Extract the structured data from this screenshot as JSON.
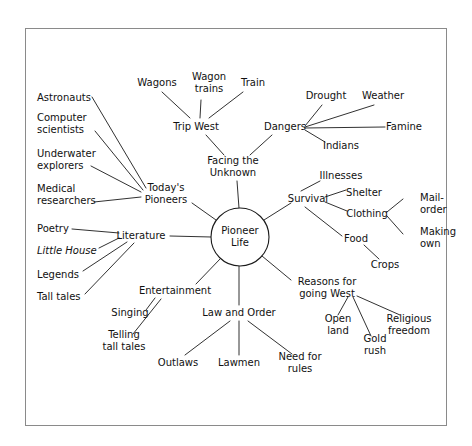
{
  "diagram": {
    "type": "mind-map",
    "title_node": "Pioneer Life",
    "frame_color": "#8a8a8a",
    "line_color": "#1a1a1a",
    "text_color": "#111111",
    "nodes": [
      {
        "id": "pioneer_life",
        "label": "Pioneer Life",
        "lines": [
          "Pioneer",
          "Life"
        ],
        "x": 240,
        "y": 237,
        "shape": "circle",
        "radius": 29,
        "anchor": "center"
      },
      {
        "id": "facing_unknown",
        "label": "Facing the Unknown",
        "lines": [
          "Facing the",
          "Unknown"
        ],
        "x": 233,
        "y": 167,
        "anchor": "center"
      },
      {
        "id": "trip_west",
        "label": "Trip West",
        "lines": [
          "Trip West"
        ],
        "x": 196,
        "y": 127,
        "anchor": "center"
      },
      {
        "id": "wagons",
        "label": "Wagons",
        "lines": [
          "Wagons"
        ],
        "x": 157,
        "y": 83,
        "anchor": "center"
      },
      {
        "id": "wagon_trains",
        "label": "Wagon trains",
        "lines": [
          "Wagon",
          "trains"
        ],
        "x": 209,
        "y": 83,
        "anchor": "center"
      },
      {
        "id": "train",
        "label": "Train",
        "lines": [
          "Train"
        ],
        "x": 253,
        "y": 83,
        "anchor": "center"
      },
      {
        "id": "dangers",
        "label": "Dangers",
        "lines": [
          "Dangers"
        ],
        "x": 285,
        "y": 127,
        "anchor": "center"
      },
      {
        "id": "drought",
        "label": "Drought",
        "lines": [
          "Drought"
        ],
        "x": 326,
        "y": 96,
        "anchor": "center"
      },
      {
        "id": "weather",
        "label": "Weather",
        "lines": [
          "Weather"
        ],
        "x": 383,
        "y": 96,
        "anchor": "center"
      },
      {
        "id": "famine",
        "label": "Famine",
        "lines": [
          "Famine"
        ],
        "x": 404,
        "y": 127,
        "anchor": "center"
      },
      {
        "id": "indians",
        "label": "Indians",
        "lines": [
          "Indians"
        ],
        "x": 341,
        "y": 146,
        "anchor": "center"
      },
      {
        "id": "survival",
        "label": "Survival",
        "lines": [
          "Survival"
        ],
        "x": 308,
        "y": 199,
        "anchor": "center"
      },
      {
        "id": "illnesses",
        "label": "Illnesses",
        "lines": [
          "Illnesses"
        ],
        "x": 341,
        "y": 176,
        "anchor": "center"
      },
      {
        "id": "shelter",
        "label": "Shelter",
        "lines": [
          "Shelter"
        ],
        "x": 364,
        "y": 193,
        "anchor": "center"
      },
      {
        "id": "clothing",
        "label": "Clothing",
        "lines": [
          "Clothing"
        ],
        "x": 367,
        "y": 214,
        "anchor": "center"
      },
      {
        "id": "mail_order",
        "label": "Mail-order",
        "lines": [
          "Mail-",
          "order"
        ],
        "x": 420,
        "y": 204,
        "anchor": "start"
      },
      {
        "id": "making_own",
        "label": "Making own",
        "lines": [
          "Making",
          "own"
        ],
        "x": 420,
        "y": 238,
        "anchor": "start"
      },
      {
        "id": "food",
        "label": "Food",
        "lines": [
          "Food"
        ],
        "x": 356,
        "y": 239,
        "anchor": "center"
      },
      {
        "id": "crops",
        "label": "Crops",
        "lines": [
          "Crops"
        ],
        "x": 385,
        "y": 265,
        "anchor": "center"
      },
      {
        "id": "reasons_west",
        "label": "Reasons for going West",
        "lines": [
          "Reasons for",
          "going West"
        ],
        "x": 327,
        "y": 288,
        "anchor": "center"
      },
      {
        "id": "open_land",
        "label": "Open land",
        "lines": [
          "Open",
          "land"
        ],
        "x": 338,
        "y": 325,
        "anchor": "center"
      },
      {
        "id": "gold_rush",
        "label": "Gold rush",
        "lines": [
          "Gold",
          "rush"
        ],
        "x": 375,
        "y": 345,
        "anchor": "center"
      },
      {
        "id": "religious_freedom",
        "label": "Religious freedom",
        "lines": [
          "Religious",
          "freedom"
        ],
        "x": 409,
        "y": 325,
        "anchor": "center"
      },
      {
        "id": "todays_pioneers",
        "label": "Today's Pioneers",
        "lines": [
          "Today's",
          "Pioneers"
        ],
        "x": 166,
        "y": 194,
        "anchor": "center"
      },
      {
        "id": "astronauts",
        "label": "Astronauts",
        "lines": [
          "Astronauts"
        ],
        "x": 37,
        "y": 98,
        "anchor": "start"
      },
      {
        "id": "computer_scientists",
        "label": "Computer scientists",
        "lines": [
          "Computer",
          "scientists"
        ],
        "x": 37,
        "y": 124,
        "anchor": "start"
      },
      {
        "id": "underwater_explorers",
        "label": "Underwater explorers",
        "lines": [
          "Underwater",
          "explorers"
        ],
        "x": 37,
        "y": 160,
        "anchor": "start"
      },
      {
        "id": "medical_researchers",
        "label": "Medical researchers",
        "lines": [
          "Medical",
          "researchers"
        ],
        "x": 37,
        "y": 195,
        "anchor": "start"
      },
      {
        "id": "literature",
        "label": "Literature",
        "lines": [
          "Literature"
        ],
        "x": 141,
        "y": 236,
        "anchor": "center"
      },
      {
        "id": "poetry",
        "label": "Poetry",
        "lines": [
          "Poetry"
        ],
        "x": 37,
        "y": 229,
        "anchor": "start"
      },
      {
        "id": "little_house",
        "label": "Little House",
        "lines": [
          "Little House"
        ],
        "x": 37,
        "y": 251,
        "anchor": "start",
        "italic": true
      },
      {
        "id": "legends",
        "label": "Legends",
        "lines": [
          "Legends"
        ],
        "x": 37,
        "y": 275,
        "anchor": "start"
      },
      {
        "id": "tall_tales",
        "label": "Tall tales",
        "lines": [
          "Tall tales"
        ],
        "x": 37,
        "y": 297,
        "anchor": "start"
      },
      {
        "id": "entertainment",
        "label": "Entertainment",
        "lines": [
          "Entertainment"
        ],
        "x": 175,
        "y": 291,
        "anchor": "center"
      },
      {
        "id": "singing",
        "label": "Singing",
        "lines": [
          "Singing"
        ],
        "x": 130,
        "y": 313,
        "anchor": "center"
      },
      {
        "id": "telling_tall_tales",
        "label": "Telling tall tales",
        "lines": [
          "Telling",
          "tall tales"
        ],
        "x": 124,
        "y": 341,
        "anchor": "center"
      },
      {
        "id": "law_and_order",
        "label": "Law and Order",
        "lines": [
          "Law and Order"
        ],
        "x": 239,
        "y": 313,
        "anchor": "center"
      },
      {
        "id": "outlaws",
        "label": "Outlaws",
        "lines": [
          "Outlaws"
        ],
        "x": 178,
        "y": 363,
        "anchor": "center"
      },
      {
        "id": "lawmen",
        "label": "Lawmen",
        "lines": [
          "Lawmen"
        ],
        "x": 239,
        "y": 363,
        "anchor": "center"
      },
      {
        "id": "need_for_rules",
        "label": "Need for rules",
        "lines": [
          "Need for",
          "rules"
        ],
        "x": 300,
        "y": 363,
        "anchor": "center"
      }
    ],
    "edges": [
      {
        "from": "pioneer_life",
        "to": "facing_unknown",
        "x1": 239,
        "y1": 208,
        "x2": 237,
        "y2": 181
      },
      {
        "from": "facing_unknown",
        "to": "trip_west",
        "x1": 224,
        "y1": 155,
        "x2": 206,
        "y2": 135
      },
      {
        "from": "trip_west",
        "to": "wagons",
        "x1": 190,
        "y1": 118,
        "x2": 162,
        "y2": 92
      },
      {
        "from": "trip_west",
        "to": "wagon_trains",
        "x1": 200,
        "y1": 118,
        "x2": 201,
        "y2": 100
      },
      {
        "from": "trip_west",
        "to": "train",
        "x1": 209,
        "y1": 118,
        "x2": 243,
        "y2": 92
      },
      {
        "from": "facing_unknown",
        "to": "dangers",
        "x1": 250,
        "y1": 155,
        "x2": 272,
        "y2": 135
      },
      {
        "from": "dangers",
        "to": "drought",
        "x1": 305,
        "y1": 126,
        "x2": 322,
        "y2": 105
      },
      {
        "from": "dangers",
        "to": "weather",
        "x1": 305,
        "y1": 127,
        "x2": 374,
        "y2": 105
      },
      {
        "from": "dangers",
        "to": "famine",
        "x1": 305,
        "y1": 128,
        "x2": 385,
        "y2": 127
      },
      {
        "from": "dangers",
        "to": "indians",
        "x1": 305,
        "y1": 130,
        "x2": 325,
        "y2": 142
      },
      {
        "from": "pioneer_life",
        "to": "survival",
        "x1": 264,
        "y1": 220,
        "x2": 291,
        "y2": 203
      },
      {
        "from": "survival",
        "to": "illnesses",
        "x1": 301,
        "y1": 191,
        "x2": 320,
        "y2": 181
      },
      {
        "from": "survival",
        "to": "shelter",
        "x1": 325,
        "y1": 197,
        "x2": 346,
        "y2": 190
      },
      {
        "from": "survival",
        "to": "clothing",
        "x1": 325,
        "y1": 202,
        "x2": 347,
        "y2": 211
      },
      {
        "from": "clothing",
        "to": "mail_order",
        "x1": 387,
        "y1": 212,
        "x2": 403,
        "y2": 199
      },
      {
        "from": "clothing",
        "to": "making_own",
        "x1": 387,
        "y1": 216,
        "x2": 403,
        "y2": 234
      },
      {
        "from": "survival",
        "to": "food",
        "x1": 305,
        "y1": 207,
        "x2": 342,
        "y2": 236
      },
      {
        "from": "food",
        "to": "crops",
        "x1": 364,
        "y1": 245,
        "x2": 379,
        "y2": 259
      },
      {
        "from": "pioneer_life",
        "to": "reasons_west",
        "x1": 262,
        "y1": 256,
        "x2": 291,
        "y2": 280
      },
      {
        "from": "reasons_west",
        "to": "open_land",
        "x1": 348,
        "y1": 297,
        "x2": 338,
        "y2": 315
      },
      {
        "from": "reasons_west",
        "to": "gold_rush",
        "x1": 353,
        "y1": 297,
        "x2": 371,
        "y2": 336
      },
      {
        "from": "reasons_west",
        "to": "religious_freedom",
        "x1": 357,
        "y1": 296,
        "x2": 400,
        "y2": 315
      },
      {
        "from": "pioneer_life",
        "to": "todays_pioneers",
        "x1": 216,
        "y1": 220,
        "x2": 192,
        "y2": 203
      },
      {
        "from": "todays_pioneers",
        "to": "astronauts",
        "x1": 146,
        "y1": 188,
        "x2": 92,
        "y2": 97
      },
      {
        "from": "todays_pioneers",
        "to": "computer_scientists",
        "x1": 143,
        "y1": 190,
        "x2": 95,
        "y2": 131
      },
      {
        "from": "todays_pioneers",
        "to": "underwater_explorers",
        "x1": 141,
        "y1": 192,
        "x2": 91,
        "y2": 166
      },
      {
        "from": "todays_pioneers",
        "to": "medical_researchers",
        "x1": 141,
        "y1": 197,
        "x2": 94,
        "y2": 202
      },
      {
        "from": "pioneer_life",
        "to": "literature",
        "x1": 211,
        "y1": 237,
        "x2": 170,
        "y2": 236
      },
      {
        "from": "literature",
        "to": "poetry",
        "x1": 119,
        "y1": 233,
        "x2": 72,
        "y2": 229
      },
      {
        "from": "literature",
        "to": "little_house",
        "x1": 119,
        "y1": 238,
        "x2": 99,
        "y2": 248
      },
      {
        "from": "literature",
        "to": "legends",
        "x1": 127,
        "y1": 242,
        "x2": 83,
        "y2": 271
      },
      {
        "from": "literature",
        "to": "tall_tales",
        "x1": 134,
        "y1": 243,
        "x2": 85,
        "y2": 294
      },
      {
        "from": "pioneer_life",
        "to": "entertainment",
        "x1": 221,
        "y1": 258,
        "x2": 196,
        "y2": 284
      },
      {
        "from": "entertainment",
        "to": "singing",
        "x1": 155,
        "y1": 298,
        "x2": 146,
        "y2": 310
      },
      {
        "from": "entertainment",
        "to": "telling_tall_tales",
        "x1": 161,
        "y1": 299,
        "x2": 133,
        "y2": 334
      },
      {
        "from": "pioneer_life",
        "to": "law_and_order",
        "x1": 239,
        "y1": 266,
        "x2": 239,
        "y2": 305
      },
      {
        "from": "law_and_order",
        "to": "outlaws",
        "x1": 230,
        "y1": 321,
        "x2": 185,
        "y2": 355
      },
      {
        "from": "law_and_order",
        "to": "lawmen",
        "x1": 239,
        "y1": 321,
        "x2": 239,
        "y2": 355
      },
      {
        "from": "law_and_order",
        "to": "need_for_rules",
        "x1": 248,
        "y1": 321,
        "x2": 292,
        "y2": 354
      }
    ]
  }
}
